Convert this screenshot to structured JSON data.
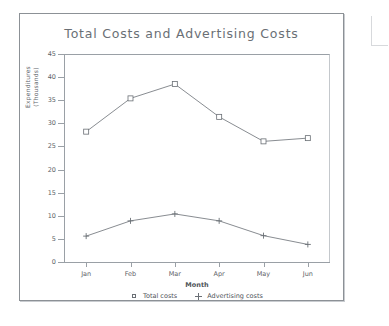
{
  "chart_data": {
    "type": "line",
    "title": "Total Costs and Advertising Costs",
    "xlabel": "Month",
    "ylabel": "Expenditures\n(Thousands)",
    "categories": [
      "Jan",
      "Feb",
      "Mar",
      "Apr",
      "May",
      "Jun"
    ],
    "ylim": [
      0,
      45
    ],
    "yticks": [
      0,
      5,
      10,
      15,
      20,
      25,
      30,
      35,
      40,
      45
    ],
    "grid": false,
    "legend_position": "bottom",
    "series": [
      {
        "name": "Total costs",
        "marker": "square",
        "color": "#6a6f75",
        "values": [
          28.2,
          35.4,
          38.5,
          31.4,
          26.1,
          26.8
        ]
      },
      {
        "name": "Advertising costs",
        "marker": "plus",
        "color": "#6a6f75",
        "values": [
          5.6,
          8.9,
          10.4,
          8.9,
          5.7,
          3.8
        ]
      }
    ]
  },
  "legend": {
    "entries": [
      {
        "label": "Total costs",
        "marker": "square"
      },
      {
        "label": "Advertising costs",
        "marker": "plus"
      }
    ]
  },
  "colors": {
    "frame": "#8c9196",
    "axis": "#9aa0a6",
    "text": "#5d6268",
    "title": "#6a6f75",
    "series": "#6a6f75",
    "background": "#ffffff"
  }
}
